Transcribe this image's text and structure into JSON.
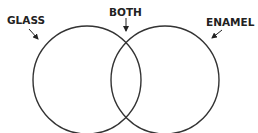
{
  "diagram": {
    "type": "venn",
    "sets": [
      {
        "id": "left",
        "label": "GLASS",
        "cx": 87,
        "cy": 80,
        "r": 54
      },
      {
        "id": "right",
        "label": "ENAMEL",
        "cx": 165,
        "cy": 80,
        "r": 54
      }
    ],
    "intersection_label": "BOTH",
    "colors": {
      "stroke": "#333333",
      "text": "#222222",
      "background": "#ffffff"
    }
  },
  "labels": {
    "left": "GLASS",
    "intersection": "BOTH",
    "right": "ENAMEL"
  }
}
